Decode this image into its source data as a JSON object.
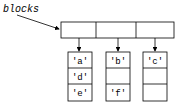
{
  "label": "blocks",
  "top_row_cells": 3,
  "columns": [
    {
      "cells": [
        "'a'",
        "'d'",
        "'e'"
      ]
    },
    {
      "cells": [
        "'b'",
        "",
        "'f'"
      ]
    },
    {
      "cells": [
        "'c'",
        "",
        ""
      ]
    }
  ],
  "colors": {
    "stroke": "#000000",
    "background": "#ffffff"
  }
}
